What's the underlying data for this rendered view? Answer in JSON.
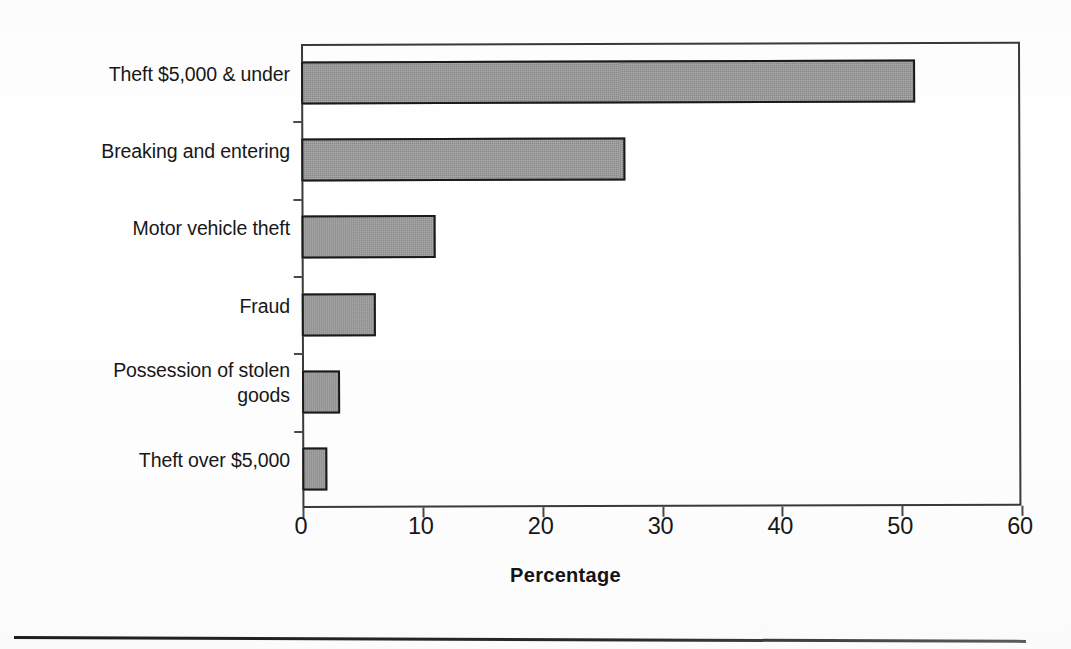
{
  "chart_data": {
    "type": "bar",
    "orientation": "horizontal",
    "title": "",
    "xlabel": "Percentage",
    "ylabel": "",
    "xlim": [
      0,
      60
    ],
    "xticks": [
      0,
      10,
      20,
      30,
      40,
      50,
      60
    ],
    "xtick_labels": [
      "0",
      "10",
      "20",
      "30",
      "40",
      "50",
      "60"
    ],
    "grid": false,
    "legend": false,
    "categories": [
      "Theft $5,000 & under",
      "Breaking and entering",
      "Motor vehicle theft",
      "Fraud",
      "Possession of stolen goods",
      "Theft over $5,000"
    ],
    "values": [
      51.2,
      27.0,
      11.2,
      6.2,
      3.2,
      2.1
    ],
    "series": [
      {
        "name": "Percentage",
        "values": [
          51.2,
          27.0,
          11.2,
          6.2,
          3.2,
          2.1
        ]
      }
    ],
    "bar_color": "#8a8a8a",
    "bar_border_color": "#1a1a1a",
    "axis_color": "#3a3a3a",
    "background_color": "#ffffff"
  },
  "axis": {
    "x_title": "Percentage",
    "tick_labels": [
      "0",
      "10",
      "20",
      "30",
      "40",
      "50",
      "60"
    ]
  },
  "categories": [
    {
      "label": "Theft $5,000 & under",
      "value": 51.2
    },
    {
      "label": "Breaking and entering",
      "value": 27.0
    },
    {
      "label": "Motor vehicle theft",
      "value": 11.2
    },
    {
      "label": "Fraud",
      "value": 6.2
    },
    {
      "label": "Possession of stolen\ngoods",
      "value": 3.2
    },
    {
      "label": "Theft over $5,000",
      "value": 2.1
    }
  ]
}
